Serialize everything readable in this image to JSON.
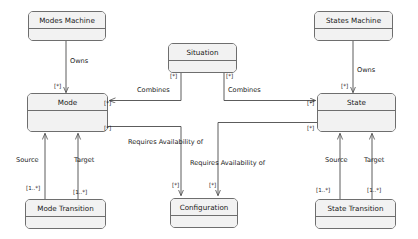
{
  "diagram": {
    "type": "uml-class-diagram",
    "background_color": "#ffffff",
    "box_fill_color": "#f2f2f2",
    "box_border_color": "#6e6e6e",
    "text_color": "#1a1a1a"
  },
  "classes": {
    "modes_machine": {
      "name": "Modes Machine"
    },
    "states_machine": {
      "name": "States Machine"
    },
    "situation": {
      "name": "Situation"
    },
    "mode": {
      "name": "Mode"
    },
    "state": {
      "name": "State"
    },
    "mode_transition": {
      "name": "Mode Transition"
    },
    "configuration": {
      "name": "Configuration"
    },
    "state_transition": {
      "name": "State Transition"
    }
  },
  "associations": {
    "owns_left": {
      "label": "Owns",
      "source": "Modes Machine",
      "target": "Mode",
      "target_multiplicity": "[*]"
    },
    "owns_right": {
      "label": "Owns",
      "source": "States Machine",
      "target": "State",
      "target_multiplicity": "[*]"
    },
    "combines_left": {
      "label": "Combines",
      "source": "Situation",
      "target": "Mode",
      "source_multiplicity": "[*]",
      "target_multiplicity": "[*]"
    },
    "combines_right": {
      "label": "Combines",
      "source": "Situation",
      "target": "State",
      "source_multiplicity": "[*]",
      "target_multiplicity": "[*]"
    },
    "requires_left": {
      "label": "Requires Availability of",
      "source": "Mode",
      "target": "Configuration",
      "source_multiplicity": "[*]",
      "target_multiplicity": "[*]"
    },
    "requires_right": {
      "label": "Requires Availability of",
      "source": "State",
      "target": "Configuration",
      "source_multiplicity": "[*]",
      "target_multiplicity": "[*]"
    },
    "mode_source": {
      "label": "Source",
      "source": "Mode Transition",
      "target": "Mode",
      "source_multiplicity": "[1..*]"
    },
    "mode_target": {
      "label": "Target",
      "source": "Mode Transition",
      "target": "Mode",
      "source_multiplicity": "[1..*]"
    },
    "state_source": {
      "label": "Source",
      "source": "State Transition",
      "target": "State",
      "source_multiplicity": "[1..*]"
    },
    "state_target": {
      "label": "Target",
      "source": "State Transition",
      "target": "State",
      "source_multiplicity": "[1..*]"
    }
  },
  "multiplicity_labels": {
    "owns_left_target": "[*]",
    "owns_right_target": "[*]",
    "situation_left": "[*]",
    "situation_right": "[*]",
    "mode_combines": "[*]",
    "state_combines": "[*]",
    "mode_requires": "[*]",
    "state_requires": "[*]",
    "config_left": "[*]",
    "config_right": "[*]",
    "mode_transition_source": "[1..*]",
    "mode_transition_target": "[1..*]",
    "state_transition_source": "[1..*]",
    "state_transition_target": "[1..*]"
  }
}
